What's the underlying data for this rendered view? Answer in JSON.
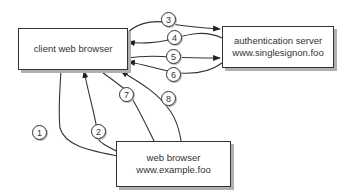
{
  "nodes": {
    "client": {
      "label": "client web browser"
    },
    "auth": {
      "line1": "authentication server",
      "line2": "www.singlesignon.foo"
    },
    "web": {
      "line1": "web browser",
      "line2": "www.example.foo"
    }
  },
  "steps": [
    "1",
    "2",
    "3",
    "4",
    "5",
    "6",
    "7",
    "8"
  ],
  "edges": [
    {
      "step": "1",
      "from": "client",
      "to": "web"
    },
    {
      "step": "2",
      "from": "web",
      "to": "client"
    },
    {
      "step": "3",
      "from": "client",
      "to": "auth"
    },
    {
      "step": "4",
      "from": "auth",
      "to": "client"
    },
    {
      "step": "5",
      "from": "client",
      "to": "auth"
    },
    {
      "step": "6",
      "from": "auth",
      "to": "client"
    },
    {
      "step": "7",
      "from": "client",
      "to": "web"
    },
    {
      "step": "8",
      "from": "web",
      "to": "client"
    }
  ],
  "colors": {
    "stroke": "#333333",
    "shadow": "#b0b0b0"
  }
}
